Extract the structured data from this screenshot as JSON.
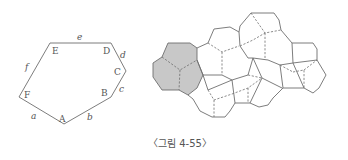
{
  "figure": {
    "caption": "〈그림 4-55〉",
    "pentagon_shape": {
      "vertex_labels": [
        "A",
        "B",
        "C",
        "D",
        "E",
        "F"
      ],
      "side_labels": [
        "a",
        "b",
        "c",
        "d",
        "e",
        "f"
      ]
    },
    "tiling": {
      "highlight_color": "#c8c8c8",
      "line_color": "#6e6e6e"
    }
  }
}
